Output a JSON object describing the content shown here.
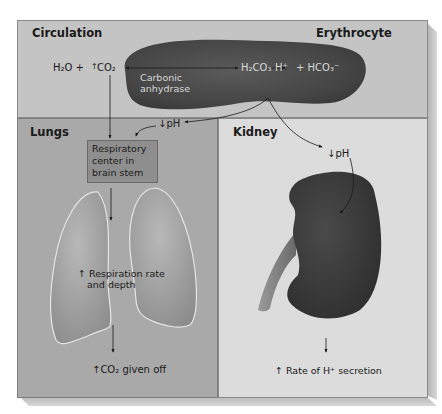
{
  "regions": {
    "circulation": {
      "title": "Circulation"
    },
    "erythrocyte": {
      "title": "Erythrocyte"
    },
    "lungs": {
      "title": "Lungs"
    },
    "kidney": {
      "title": "Kidney"
    }
  },
  "reaction": {
    "h2o": "H₂O +",
    "co2": "CO₂",
    "co2_arrow": "↑",
    "enzyme_line1": "Carbonic",
    "enzyme_line2": "anhydrase",
    "h2co3": "H₂CO₃",
    "h_plus": "H⁺",
    "hco3": "+ HCO₃⁻"
  },
  "lungs_labels": {
    "ph": "↓pH",
    "resp_center_line1": "Respiratory",
    "resp_center_line2": "center in",
    "resp_center_line3": "brain stem",
    "resp_rate_line1": "↑ Respiration rate",
    "resp_rate_line2": "and depth",
    "co2_given_off": "↑CO₂ given off"
  },
  "kidney_labels": {
    "ph": "↓pH",
    "h_secretion": "↑ Rate of H⁺ secretion"
  },
  "colors": {
    "circulation_bg": "#c4c4c4",
    "lungs_bg": "#a9a9a9",
    "kidney_bg": "#dcdcdc",
    "erythrocyte": "#4a4a4a",
    "kidney_organ": "#3c3c3c",
    "lung_organ": "#9a9a9a"
  }
}
